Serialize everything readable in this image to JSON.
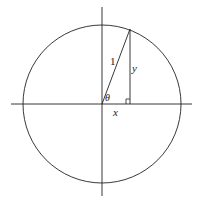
{
  "diagram": {
    "type": "unit-circle",
    "labels": {
      "hypotenuse": "1",
      "opposite": "y",
      "adjacent": "x",
      "angle": "θ"
    },
    "colors": {
      "stroke": "#222222",
      "background": "#ffffff"
    }
  }
}
